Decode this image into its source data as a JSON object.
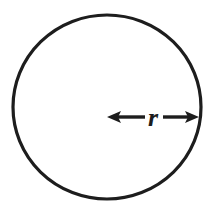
{
  "figure": {
    "name": "circle-radius-diagram",
    "type": "geometry-diagram",
    "background_color": "#ffffff",
    "stroke_color": "#1d1d1d",
    "canvas": {
      "width": 217,
      "height": 209
    }
  },
  "circle": {
    "name": "circle-outline",
    "center_x": 107,
    "center_y": 107,
    "radius_x": 94,
    "radius_y": 92,
    "stroke_width": 3.2,
    "fill": "none",
    "stroke_color": "#1d1d1d"
  },
  "radius_arrow": {
    "name": "radius-double-arrow",
    "label": "r",
    "label_meaning": "radius",
    "start_x": 107,
    "end_x": 199,
    "y": 117,
    "shaft_width": 3.4,
    "head_length": 13,
    "head_width": 13,
    "double_headed": true,
    "color": "#1d1d1d"
  },
  "label": {
    "name": "radius-label",
    "text": "r",
    "x": 153,
    "y": 126,
    "font_size": 26,
    "italic": true,
    "bold": true,
    "color": "#1d1d1d"
  }
}
